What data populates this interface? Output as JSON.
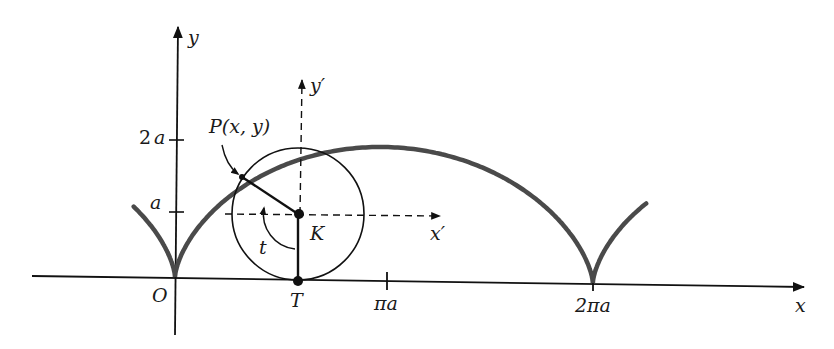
{
  "figure": {
    "curve_color": "#4a4a4a",
    "line_color": "#111111"
  },
  "axes": {
    "x_label": "x",
    "y_label": "y",
    "origin_label": "O",
    "y_ticks": [
      {
        "label": "a",
        "value": "a"
      },
      {
        "label": "2a",
        "value": "2a"
      }
    ],
    "x_ticks": [
      {
        "label": "πa",
        "value": "πa"
      },
      {
        "label": "2πa",
        "value": "2πa"
      }
    ]
  },
  "moving_frame": {
    "x_prime_label": "x′",
    "y_prime_label": "y′"
  },
  "points": {
    "P_label": "P(x, y)",
    "K_label": "K",
    "T_label": "T"
  },
  "angle": {
    "label": "t"
  }
}
